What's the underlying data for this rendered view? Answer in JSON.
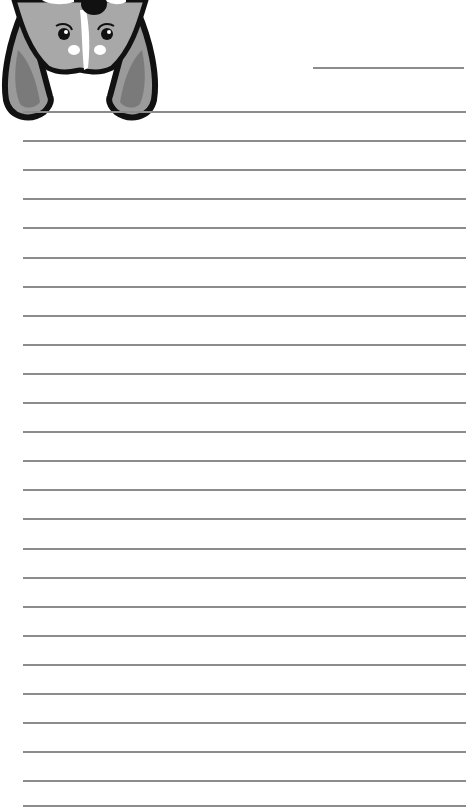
{
  "page": {
    "type": "lined-notepad",
    "background_color": "#ffffff",
    "rule_color": "#8c8c8c"
  },
  "header": {
    "illustration": "corgi-upside-down-icon",
    "title_line": {
      "x1": 313,
      "x2": 464,
      "y": 67
    }
  },
  "rules": {
    "x1": 23,
    "x2": 466,
    "first_y": 111,
    "spacing": 29.1,
    "count": 24,
    "last_line_y": 805
  }
}
